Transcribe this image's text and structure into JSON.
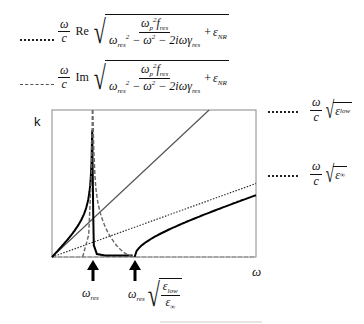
{
  "legend": [
    {
      "style": "dotted",
      "prefix_num": "ω",
      "prefix_den": "c",
      "operator": "Re",
      "numerator": "ωp² f_res",
      "denominator": "ω_res² − ω² − 2iωγ_res",
      "suffix": "+ ε_NR"
    },
    {
      "style": "dashed",
      "prefix_num": "ω",
      "prefix_den": "c",
      "operator": "Im",
      "numerator": "ωp² f_res",
      "denominator": "ω_res² − ω² − 2iωγ_res",
      "suffix": "+ ε_NR"
    }
  ],
  "side_labels": [
    {
      "style": "dotted",
      "num": "ω",
      "den": "c",
      "radicand": "ε",
      "radicand_sub": "low"
    },
    {
      "style": "dotted",
      "num": "ω",
      "den": "c",
      "radicand": "ε",
      "radicand_sub": "∞"
    }
  ],
  "axes": {
    "y_label": "k",
    "x_label": "ω"
  },
  "markers": [
    {
      "label": "ω",
      "label_sub": "res"
    },
    {
      "label": "ω",
      "label_sub": "res",
      "radical_num": "ε",
      "radical_num_sub": "low",
      "radical_den": "ε",
      "radical_den_sub": "∞"
    }
  ],
  "chart_data": {
    "type": "line",
    "title": "",
    "xlabel": "ω",
    "ylabel": "k",
    "grid": false,
    "x_range": [
      0,
      1
    ],
    "y_range": [
      0,
      1
    ],
    "annotations": [
      "ω_res",
      "ω_res·sqrt(ε_low/ε_∞)"
    ],
    "series": [
      {
        "name": "(ω/c)·Re sqrt(ωp² f_res/(ω_res² − ω² − 2iωγ_res) + ε_NR)",
        "style": "solid-thick"
      },
      {
        "name": "(ω/c)·Im sqrt(ωp² f_res/(ω_res² − ω² − 2iωγ_res) + ε_NR)",
        "style": "dashed"
      },
      {
        "name": "(ω/c)·sqrt(ε_low)",
        "style": "solid-thin"
      },
      {
        "name": "(ω/c)·sqrt(ε_∞)",
        "style": "dotted"
      }
    ],
    "params": {
      "omega_res": 0.2,
      "omega_upper": 0.405,
      "eps_low": 3.2,
      "eps_inf": 0.75
    }
  }
}
